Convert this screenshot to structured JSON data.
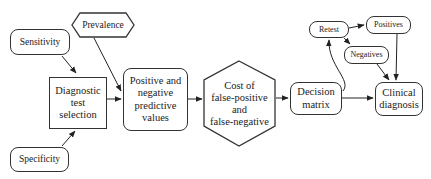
{
  "diagram": {
    "type": "flowchart",
    "nodes": {
      "prevalence": {
        "label": "Prevalence",
        "shape": "hexagon"
      },
      "sensitivity": {
        "label": "Sensitivity",
        "shape": "rounded-rectangle"
      },
      "specificity": {
        "label": "Specificity",
        "shape": "rounded-rectangle"
      },
      "diagnostic_test_selection": {
        "label": "Diagnostic\ntest\nselection",
        "shape": "rectangle"
      },
      "predictive_values": {
        "label": "Positive and\nnegative\npredictive\nvalues",
        "shape": "rounded-rectangle"
      },
      "cost": {
        "label": "Cost of\nfalse-positive\nand\nfalse-negative",
        "shape": "hexagon"
      },
      "decision_matrix": {
        "label": "Decision\nmatrix",
        "shape": "rounded-rectangle"
      },
      "retest": {
        "label": "Retest",
        "shape": "rounded-rectangle"
      },
      "positives": {
        "label": "Positives",
        "shape": "rounded-rectangle"
      },
      "negatives": {
        "label": "Negatives",
        "shape": "rounded-rectangle"
      },
      "clinical_diagnosis": {
        "label": "Clinical\ndiagnosis",
        "shape": "rounded-rectangle"
      }
    },
    "edges": [
      {
        "from": "sensitivity",
        "to": "diagnostic_test_selection"
      },
      {
        "from": "specificity",
        "to": "diagnostic_test_selection"
      },
      {
        "from": "prevalence",
        "to": "predictive_values"
      },
      {
        "from": "diagnostic_test_selection",
        "to": "predictive_values"
      },
      {
        "from": "predictive_values",
        "to": "cost"
      },
      {
        "from": "cost",
        "to": "decision_matrix"
      },
      {
        "from": "decision_matrix",
        "to": "clinical_diagnosis"
      },
      {
        "from": "decision_matrix",
        "to": "retest"
      },
      {
        "from": "retest",
        "to": "positives"
      },
      {
        "from": "retest",
        "to": "negatives"
      },
      {
        "from": "positives",
        "to": "clinical_diagnosis"
      },
      {
        "from": "negatives",
        "to": "clinical_diagnosis"
      }
    ],
    "colors": {
      "stroke": "#333333",
      "fill": "#ffffff",
      "text": "#222222"
    }
  }
}
